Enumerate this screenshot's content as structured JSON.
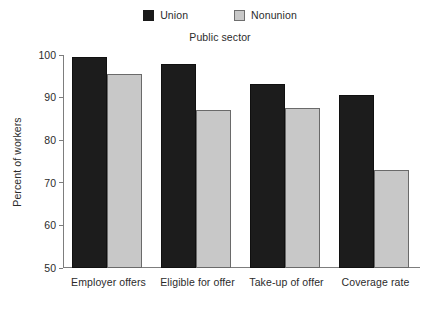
{
  "chart_data": {
    "type": "bar",
    "title": "Public sector",
    "xlabel": "",
    "ylabel": "Percent of workers",
    "categories": [
      "Employer offers",
      "Eligible for offer",
      "Take-up of offer",
      "Coverage rate"
    ],
    "series": [
      {
        "name": "Union",
        "color": "#1c1c1c",
        "values": [
          99.5,
          97.8,
          93.2,
          90.5
        ]
      },
      {
        "name": "Nonunion",
        "color": "#c8c8c8",
        "values": [
          95.6,
          87.0,
          87.5,
          73.0
        ]
      }
    ],
    "ylim": [
      50,
      100
    ],
    "yticks": [
      50,
      60,
      70,
      80,
      90,
      100
    ],
    "ytick_labels": [
      "50",
      "60",
      "70",
      "80",
      "90",
      "100"
    ],
    "grid": false,
    "legend_position": "top-center"
  },
  "legend": {
    "entries": [
      {
        "label": "Union",
        "swatch": "union-swatch"
      },
      {
        "label": "Nonunion",
        "swatch": "nonunion-swatch"
      }
    ]
  },
  "colors": {
    "union": "#1c1c1c",
    "nonunion": "#c8c8c8",
    "axis": "#7d7d7d",
    "text": "#2b2b2b",
    "background": "#ffffff"
  }
}
